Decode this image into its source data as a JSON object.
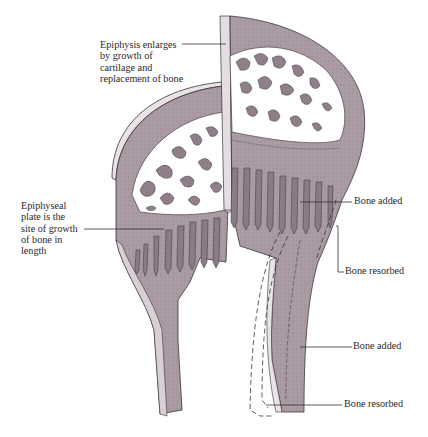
{
  "diagram": {
    "colors": {
      "bone_fill": "#a99aa3",
      "bone_dark": "#7d6f77",
      "cut_face": "#d8d0d4",
      "trabecular_fill": "#ffffff",
      "outline": "#3a3438",
      "label_line": "#333333"
    },
    "labels": {
      "epiphysis": "Epiphysis enlarges\nby growth of\ncartilage and\nreplacement of bone",
      "epiphyseal_plate": "Epiphyseal\nplate is the\nsite of growth\nof bone in\nlength",
      "bone_added_upper": "Bone added",
      "bone_resorbed_upper": "Bone resorbed",
      "bone_added_lower": "Bone added",
      "bone_resorbed_lower": "Bone resorbed"
    }
  }
}
